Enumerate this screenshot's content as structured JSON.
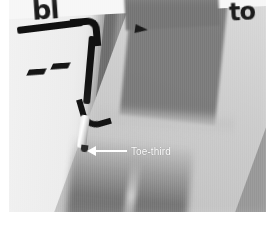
{
  "figure": {
    "kind": "photograph",
    "background_color": "#ffffff"
  },
  "photo": {
    "base_color": "#9a9a9a",
    "printed_text_left": "bl",
    "printed_text_right": "to"
  },
  "annotation": {
    "label": "Toe-third",
    "arrow_direction": "left",
    "color": "#ffffff"
  },
  "elements": {
    "probe_name": "dental-probe",
    "probe_color": "#101010",
    "probe_tip_color": "#ffffff",
    "dash_mark_color": "#151515",
    "specimen_color": "#8c8c8c"
  }
}
